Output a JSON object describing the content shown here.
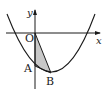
{
  "diagram": {
    "type": "parabola-triangle",
    "axes": {
      "x_label": "x",
      "y_label": "y"
    },
    "points": [
      {
        "name": "O",
        "label": "O",
        "desc": "origin"
      },
      {
        "name": "A",
        "label": "A",
        "desc": "parabola intersects y-axis"
      },
      {
        "name": "B",
        "label": "B",
        "desc": "vertex of parabola"
      }
    ],
    "shaded_region": "triangle OAB",
    "colors": {
      "stroke": "#1a1a1a",
      "fill": "#c8c8c8"
    }
  }
}
